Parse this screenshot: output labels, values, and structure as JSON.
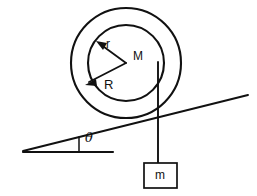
{
  "diagram": {
    "colors": {
      "stroke": "#111111",
      "background": "#ffffff"
    },
    "labels": {
      "inner_radius": "r",
      "outer_radius": "R",
      "pulley_mass": "M",
      "incline_angle": "θ",
      "hanging_mass": "m"
    },
    "shapes": {
      "outer_circle": {
        "cx": 126,
        "cy": 63,
        "r": 55
      },
      "inner_circle": {
        "cx": 126,
        "cy": 63,
        "r": 38
      },
      "hub_point": {
        "cx": 126,
        "cy": 63
      },
      "radius_r_arrow": {
        "x1": 126,
        "y1": 63,
        "x2": 98,
        "y2": 42
      },
      "radius_R_arrow": {
        "x1": 126,
        "y1": 63,
        "x2": 87,
        "y2": 84
      },
      "incline_line": {
        "x1": 23,
        "y1": 151,
        "x2": 248,
        "y2": 95
      },
      "horizontal_line": {
        "x1": 23,
        "y1": 152,
        "x2": 113,
        "y2": 152
      },
      "angle_tick": {
        "x1": 79,
        "y1": 138,
        "x2": 79,
        "y2": 152
      },
      "string_line": {
        "x1": 158,
        "y1": 63,
        "x2": 158,
        "y2": 163
      },
      "mass_box": {
        "x": 144,
        "y": 163,
        "width": 33,
        "height": 25
      }
    }
  }
}
